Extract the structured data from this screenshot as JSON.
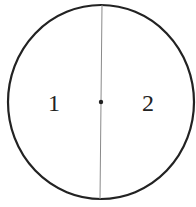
{
  "diagram": {
    "type": "circle-divided-by-diameter",
    "regions": [
      {
        "label": "1",
        "side": "left"
      },
      {
        "label": "2",
        "side": "right"
      }
    ],
    "center_point": true,
    "colors": {
      "stroke": "#222222",
      "divider": "#8a8a8a",
      "background": "#ffffff"
    }
  }
}
